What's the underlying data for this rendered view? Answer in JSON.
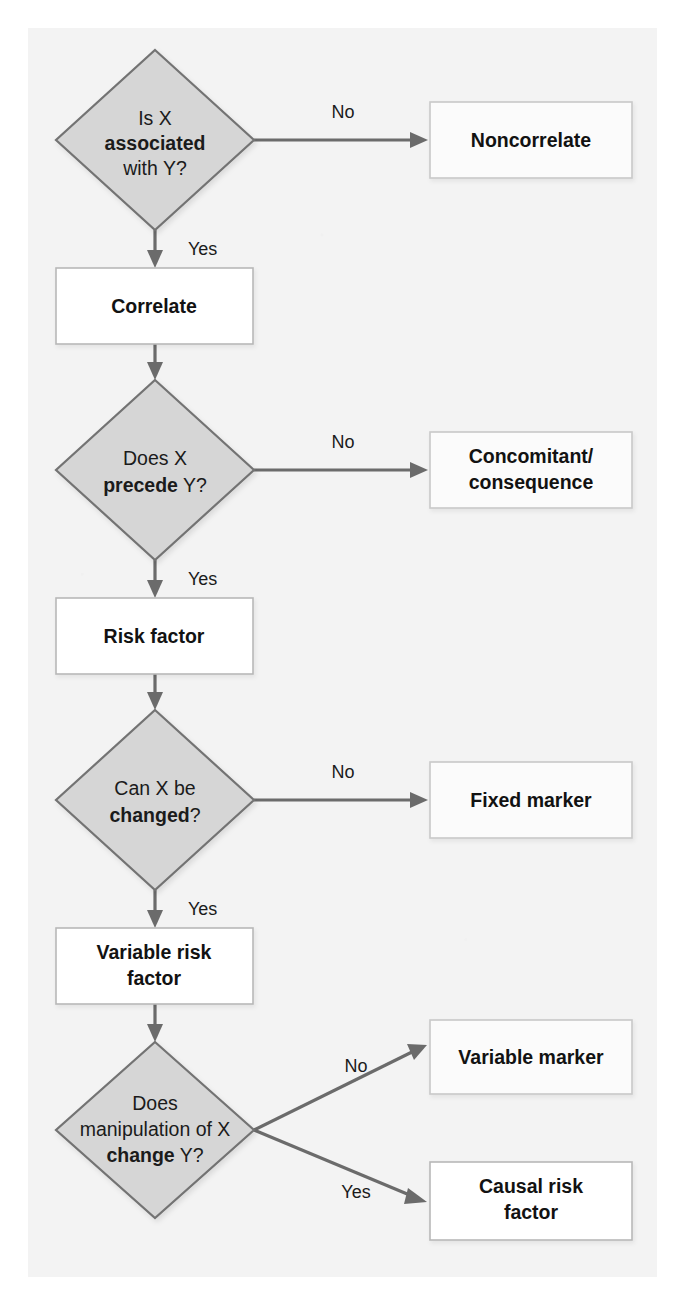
{
  "figure": {
    "kind": "decision-flowchart",
    "title": "",
    "canvas": {
      "width": 685,
      "height": 1305
    },
    "panel": {
      "x": 28,
      "y": 28,
      "width": 629,
      "height": 1249,
      "fill": "#f3f3f3"
    },
    "colors": {
      "diamond_fill": "#d6d6d6",
      "diamond_stroke": "#737373",
      "box_fill": "#ffffff",
      "box_stroke": "#b8b8b8",
      "outcome_fill": "#fbfbfb",
      "outcome_stroke": "#c9c9c9",
      "connector": "#6b6b6b",
      "text": "#1b1b1b",
      "background": "#f3f3f3"
    }
  },
  "decisions": [
    {
      "id": "d1",
      "name": "is-x-associated-with-y",
      "lines": [
        {
          "text": "Is X",
          "bold": false
        },
        {
          "text": "associated",
          "bold": true
        },
        {
          "text": "with Y?",
          "bold": false
        }
      ],
      "cx": 155,
      "cy": 140,
      "rx": 99,
      "ry": 90
    },
    {
      "id": "d2",
      "name": "does-x-precede-y",
      "lines": [
        {
          "text": "Does X",
          "bold": false
        },
        {
          "text": "precede Y?",
          "bold": "mixed",
          "bold_part": "precede",
          "rest": " Y?"
        }
      ],
      "cx": 155,
      "cy": 470,
      "rx": 99,
      "ry": 90
    },
    {
      "id": "d3",
      "name": "can-x-be-changed",
      "lines": [
        {
          "text": "Can X be",
          "bold": false
        },
        {
          "text": "changed?",
          "bold": "mixed",
          "bold_part": "changed",
          "rest": "?"
        }
      ],
      "cx": 155,
      "cy": 800,
      "rx": 99,
      "ry": 90
    },
    {
      "id": "d4",
      "name": "does-manipulation-of-x-change-y",
      "lines": [
        {
          "text": "Does",
          "bold": false
        },
        {
          "text": "manipulation of X",
          "bold": false
        },
        {
          "text": "change Y?",
          "bold": "mixed",
          "bold_part": "change",
          "rest": " Y?"
        }
      ],
      "cx": 155,
      "cy": 1130,
      "rx": 99,
      "ry": 88
    }
  ],
  "process_boxes": [
    {
      "id": "p1",
      "name": "correlate",
      "lines": [
        "Correlate"
      ],
      "x": 56,
      "y": 268,
      "width": 197,
      "height": 76
    },
    {
      "id": "p2",
      "name": "risk-factor",
      "lines": [
        "Risk factor"
      ],
      "x": 56,
      "y": 598,
      "width": 197,
      "height": 76
    },
    {
      "id": "p3",
      "name": "variable-risk-factor",
      "lines": [
        "Variable risk",
        "factor"
      ],
      "x": 56,
      "y": 928,
      "width": 197,
      "height": 76
    }
  ],
  "outcome_boxes": [
    {
      "id": "o1",
      "name": "noncorrelate",
      "lines": [
        "Noncorrelate"
      ],
      "x": 430,
      "y": 102,
      "width": 202,
      "height": 76
    },
    {
      "id": "o2",
      "name": "concomitant-consequence",
      "lines": [
        "Concomitant/",
        "consequence"
      ],
      "x": 430,
      "y": 432,
      "width": 202,
      "height": 76
    },
    {
      "id": "o3",
      "name": "fixed-marker",
      "lines": [
        "Fixed marker"
      ],
      "x": 430,
      "y": 762,
      "width": 202,
      "height": 76
    },
    {
      "id": "o4",
      "name": "variable-marker",
      "lines": [
        "Variable marker"
      ],
      "x": 430,
      "y": 1020,
      "width": 202,
      "height": 74
    },
    {
      "id": "o5",
      "name": "causal-risk-factor",
      "lines": [
        "Causal risk",
        "factor"
      ],
      "x": 430,
      "y": 1162,
      "width": 202,
      "height": 78
    }
  ],
  "edges": [
    {
      "id": "e1",
      "name": "edge-d1-no-noncorrelate",
      "label": "No",
      "from": "d1",
      "to": "o1",
      "label_x": 343,
      "label_y": 122,
      "kind": "horizontal"
    },
    {
      "id": "e2",
      "name": "edge-d1-yes-correlate",
      "label": "Yes",
      "from": "d1",
      "to": "p1",
      "label_x": 186,
      "label_y": 250,
      "kind": "vertical"
    },
    {
      "id": "e3",
      "name": "edge-correlate-d2",
      "label": "",
      "from": "p1",
      "to": "d2",
      "kind": "vertical"
    },
    {
      "id": "e4",
      "name": "edge-d2-no-concomitant",
      "label": "No",
      "from": "d2",
      "to": "o2",
      "label_x": 343,
      "label_y": 452,
      "kind": "horizontal"
    },
    {
      "id": "e5",
      "name": "edge-d2-yes-risk-factor",
      "label": "Yes",
      "from": "d2",
      "to": "p2",
      "label_x": 186,
      "label_y": 580,
      "kind": "vertical"
    },
    {
      "id": "e6",
      "name": "edge-risk-factor-d3",
      "label": "",
      "from": "p2",
      "to": "d3",
      "kind": "vertical"
    },
    {
      "id": "e7",
      "name": "edge-d3-no-fixed-marker",
      "label": "No",
      "from": "d3",
      "to": "o3",
      "label_x": 343,
      "label_y": 782,
      "kind": "horizontal"
    },
    {
      "id": "e8",
      "name": "edge-d3-yes-variable-risk-factor",
      "label": "Yes",
      "from": "d3",
      "to": "p3",
      "label_x": 186,
      "label_y": 910,
      "kind": "vertical"
    },
    {
      "id": "e9",
      "name": "edge-variable-risk-factor-d4",
      "label": "",
      "from": "p3",
      "to": "d4",
      "kind": "vertical"
    },
    {
      "id": "e10",
      "name": "edge-d4-no-variable-marker",
      "label": "No",
      "from": "d4",
      "to": "o4",
      "label_x": 355,
      "label_y": 1068,
      "kind": "diagonal-up"
    },
    {
      "id": "e11",
      "name": "edge-d4-yes-causal-risk-factor",
      "label": "Yes",
      "from": "d4",
      "to": "o5",
      "label_x": 355,
      "label_y": 1200,
      "kind": "diagonal-down"
    }
  ]
}
